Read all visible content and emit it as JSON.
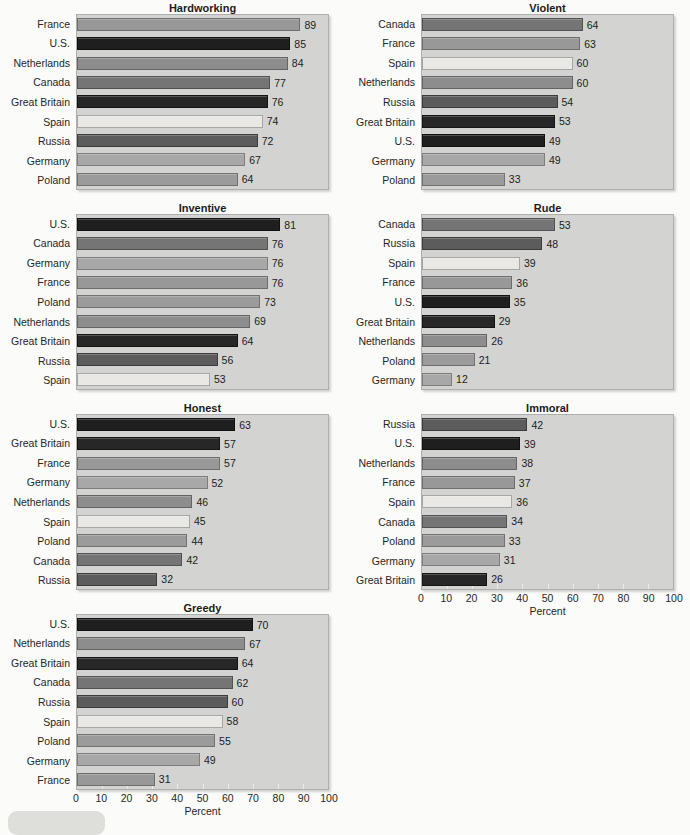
{
  "figure": {
    "axis_label": "Percent",
    "axis_ticks": [
      0,
      10,
      20,
      30,
      40,
      50,
      60,
      70,
      80,
      90,
      100
    ],
    "xlim": [
      0,
      100
    ]
  },
  "colors": {
    "page_bg": "#fbfbf9",
    "plot_bg": "#d3d3d1",
    "plot_border": "#aeaeac",
    "text": "#1c1c1c",
    "countries": {
      "U.S.": {
        "fill": "#1f1f1f",
        "border": "#111111"
      },
      "Great Britain": {
        "fill": "#272727",
        "border": "#141414"
      },
      "Russia": {
        "fill": "#5c5c5c",
        "border": "#3c3c3c"
      },
      "Canada": {
        "fill": "#757575",
        "border": "#525252"
      },
      "Netherlands": {
        "fill": "#8d8d8d",
        "border": "#646464"
      },
      "France": {
        "fill": "#989898",
        "border": "#6e6e6e"
      },
      "Poland": {
        "fill": "#9b9b9b",
        "border": "#717171"
      },
      "Germany": {
        "fill": "#a8a8a8",
        "border": "#7d7d7d"
      },
      "Spain": {
        "fill": "#e9e8e4",
        "border": "#a6a6a2"
      }
    }
  },
  "chart_data": [
    {
      "type": "bar",
      "title": "Hardworking",
      "show_axis": false,
      "xlabel": "Percent",
      "xlim": [
        0,
        100
      ],
      "categories": [
        "France",
        "U.S.",
        "Netherlands",
        "Canada",
        "Great Britain",
        "Spain",
        "Russia",
        "Germany",
        "Poland"
      ],
      "values": [
        89,
        85,
        84,
        77,
        76,
        74,
        72,
        67,
        64
      ]
    },
    {
      "type": "bar",
      "title": "Violent",
      "show_axis": false,
      "xlabel": "Percent",
      "xlim": [
        0,
        100
      ],
      "categories": [
        "Canada",
        "France",
        "Spain",
        "Netherlands",
        "Russia",
        "Great Britain",
        "U.S.",
        "Germany",
        "Poland"
      ],
      "values": [
        64,
        63,
        60,
        60,
        54,
        53,
        49,
        49,
        33
      ]
    },
    {
      "type": "bar",
      "title": "Inventive",
      "show_axis": false,
      "xlabel": "Percent",
      "xlim": [
        0,
        100
      ],
      "categories": [
        "U.S.",
        "Canada",
        "Germany",
        "France",
        "Poland",
        "Netherlands",
        "Great Britain",
        "Russia",
        "Spain"
      ],
      "values": [
        81,
        76,
        76,
        76,
        73,
        69,
        64,
        56,
        53
      ]
    },
    {
      "type": "bar",
      "title": "Rude",
      "show_axis": false,
      "xlabel": "Percent",
      "xlim": [
        0,
        100
      ],
      "categories": [
        "Canada",
        "Russia",
        "Spain",
        "France",
        "U.S.",
        "Great Britain",
        "Netherlands",
        "Poland",
        "Germany"
      ],
      "values": [
        53,
        48,
        39,
        36,
        35,
        29,
        26,
        21,
        12
      ]
    },
    {
      "type": "bar",
      "title": "Honest",
      "show_axis": false,
      "xlabel": "Percent",
      "xlim": [
        0,
        100
      ],
      "categories": [
        "U.S.",
        "Great Britain",
        "France",
        "Germany",
        "Netherlands",
        "Spain",
        "Poland",
        "Canada",
        "Russia"
      ],
      "values": [
        63,
        57,
        57,
        52,
        46,
        45,
        44,
        42,
        32
      ]
    },
    {
      "type": "bar",
      "title": "Immoral",
      "show_axis": true,
      "xlabel": "Percent",
      "xlim": [
        0,
        100
      ],
      "categories": [
        "Russia",
        "U.S.",
        "Netherlands",
        "France",
        "Spain",
        "Canada",
        "Poland",
        "Germany",
        "Great Britain"
      ],
      "values": [
        42,
        39,
        38,
        37,
        36,
        34,
        33,
        31,
        26
      ]
    },
    {
      "type": "bar",
      "title": "Greedy",
      "show_axis": true,
      "xlabel": "Percent",
      "xlim": [
        0,
        100
      ],
      "categories": [
        "U.S.",
        "Netherlands",
        "Great Britain",
        "Canada",
        "Russia",
        "Spain",
        "Poland",
        "Germany",
        "France"
      ],
      "values": [
        70,
        67,
        64,
        62,
        60,
        58,
        55,
        49,
        31
      ]
    }
  ]
}
